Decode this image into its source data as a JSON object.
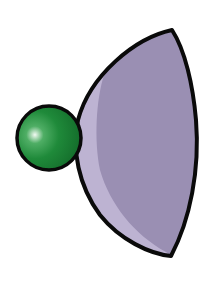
{
  "illustration": {
    "description": "Green sphere attached to a purple half-dome (lens/bowl) shape",
    "colors": {
      "background": "#ffffff",
      "outline": "#0a0a0a",
      "dome_fill": "#9a8fb3",
      "dome_highlight": "#bdb3d2",
      "sphere_base": "#1f8a3a",
      "sphere_dark": "#136b2a",
      "sphere_highlight": "#e8f5ea"
    }
  }
}
